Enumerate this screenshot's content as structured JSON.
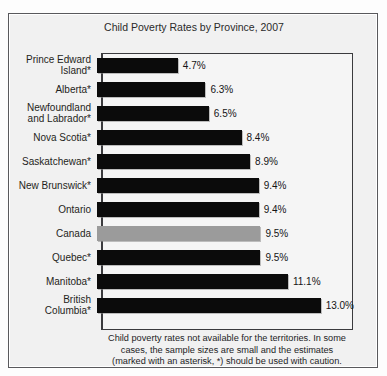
{
  "top_bleed_text": "",
  "figure": {
    "title": "Child Poverty Rates by Province, 2007",
    "bar_color": "#0b0b0b",
    "highlight_color": "#9b9b9b",
    "panel_color": "#f1f1f1",
    "footnote_lines": [
      "Child poverty rates not available for the territories. In some",
      "cases, the sample sizes are small and the estimates",
      "(marked with an asterisk, *) should be used with caution."
    ]
  },
  "chart_data": {
    "type": "bar",
    "orientation": "horizontal",
    "title": "Child Poverty Rates by Province, 2007",
    "xlabel": "",
    "ylabel": "",
    "xlim": [
      0,
      14.3
    ],
    "grid": false,
    "legend": "none",
    "categories": [
      "Prince Edward Island*",
      "Alberta*",
      "Newfoundland and Labrador*",
      "Nova Scotia*",
      "Saskatchewan*",
      "New Brunswick*",
      "Ontario",
      "Canada",
      "Quebec*",
      "Manitoba*",
      "British Columbia*"
    ],
    "values": [
      4.7,
      6.3,
      6.5,
      8.4,
      8.9,
      9.4,
      9.4,
      9.5,
      9.5,
      11.1,
      13.0
    ],
    "value_labels": [
      "4.7%",
      "6.3%",
      "6.5%",
      "8.4%",
      "8.9%",
      "9.4%",
      "9.4%",
      "9.5%",
      "9.5%",
      "11.1%",
      "13.0%"
    ],
    "rows": [
      {
        "label_line1": "Prince Edward",
        "label_line2": "Island*",
        "value": 4.7,
        "value_label": "4.7%",
        "highlight": false
      },
      {
        "label_line1": "Alberta*",
        "label_line2": "",
        "value": 6.3,
        "value_label": "6.3%",
        "highlight": false
      },
      {
        "label_line1": "Newfoundland",
        "label_line2": "and Labrador*",
        "value": 6.5,
        "value_label": "6.5%",
        "highlight": false
      },
      {
        "label_line1": "Nova Scotia*",
        "label_line2": "",
        "value": 8.4,
        "value_label": "8.4%",
        "highlight": false
      },
      {
        "label_line1": "Saskatchewan*",
        "label_line2": "",
        "value": 8.9,
        "value_label": "8.9%",
        "highlight": false
      },
      {
        "label_line1": "New Brunswick*",
        "label_line2": "",
        "value": 9.4,
        "value_label": "9.4%",
        "highlight": false
      },
      {
        "label_line1": "Ontario",
        "label_line2": "",
        "value": 9.4,
        "value_label": "9.4%",
        "highlight": false
      },
      {
        "label_line1": "Canada",
        "label_line2": "",
        "value": 9.5,
        "value_label": "9.5%",
        "highlight": true
      },
      {
        "label_line1": "Quebec*",
        "label_line2": "",
        "value": 9.5,
        "value_label": "9.5%",
        "highlight": false
      },
      {
        "label_line1": "Manitoba*",
        "label_line2": "",
        "value": 11.1,
        "value_label": "11.1%",
        "highlight": false
      },
      {
        "label_line1": "British",
        "label_line2": "Columbia*",
        "value": 13.0,
        "value_label": "13.0%",
        "highlight": false
      }
    ]
  }
}
